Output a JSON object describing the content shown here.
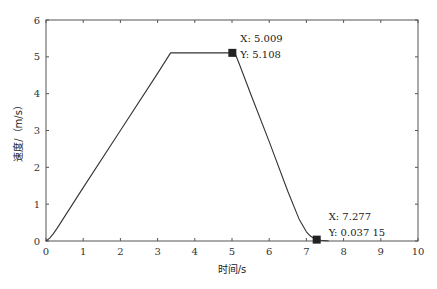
{
  "chart_data": {
    "type": "line",
    "title": "",
    "xlabel": "时间/s",
    "ylabel": "速度/（m/s）",
    "xlim": [
      0,
      10
    ],
    "ylim": [
      0,
      6
    ],
    "xticks": [
      0,
      1,
      2,
      3,
      4,
      5,
      6,
      7,
      8,
      9,
      10
    ],
    "yticks": [
      0,
      1,
      2,
      3,
      4,
      5,
      6
    ],
    "grid": false,
    "legend": null,
    "series": [
      {
        "name": "speed",
        "color": "#333333",
        "x": [
          0,
          0.1,
          0.2,
          0.3,
          1.0,
          2.0,
          3.0,
          3.35,
          4.0,
          5.009,
          5.1,
          5.2,
          5.5,
          6.0,
          6.5,
          6.8,
          7.0,
          7.1,
          7.2,
          7.277,
          7.4,
          7.6
        ],
        "y": [
          0,
          0.08,
          0.2,
          0.35,
          1.45,
          3.0,
          4.55,
          5.108,
          5.108,
          5.108,
          5.05,
          4.8,
          4.0,
          2.7,
          1.35,
          0.6,
          0.25,
          0.14,
          0.07,
          0.03715,
          0.02,
          0.0
        ]
      }
    ],
    "annotations": [
      {
        "x": 5.009,
        "y": 5.108,
        "label_x": "X: 5.009",
        "label_y": "Y: 5.108",
        "marker": "square"
      },
      {
        "x": 7.277,
        "y": 0.03715,
        "label_x": "X: 7.277",
        "label_y": "Y: 0.037 15",
        "marker": "square"
      }
    ]
  },
  "labels": {
    "xlabel": "时间/s",
    "ylabel": "速度/（m/s）",
    "dt1_x": "X: 5.009",
    "dt1_y": "Y: 5.108",
    "dt2_x": "X: 7.277",
    "dt2_y": "Y: 0.037 15"
  }
}
